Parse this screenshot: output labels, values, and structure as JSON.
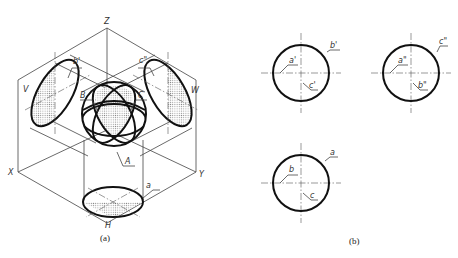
{
  "figure_a": {
    "caption": "(a)",
    "axes": {
      "z": "Z",
      "x": "X",
      "y": "Y"
    },
    "planes": {
      "v": "V",
      "w": "W",
      "h": "H"
    },
    "points": {
      "a": "A",
      "b": "B",
      "c": "C"
    },
    "projections": {
      "b_prime": "b'",
      "c_double_prime": "c\"",
      "a": "a"
    }
  },
  "figure_b": {
    "caption": "(b)",
    "front_view": {
      "outline": "b'",
      "inner_1": "a'",
      "inner_2": "c'"
    },
    "side_view": {
      "outline": "c\"",
      "inner_1": "a\"",
      "inner_2": "b\""
    },
    "top_view": {
      "outline": "a",
      "inner_1": "b",
      "inner_2": "c"
    }
  },
  "colors": {
    "line": "#111111",
    "thin_line": "#444444",
    "hatch": "#bbbbbb"
  }
}
